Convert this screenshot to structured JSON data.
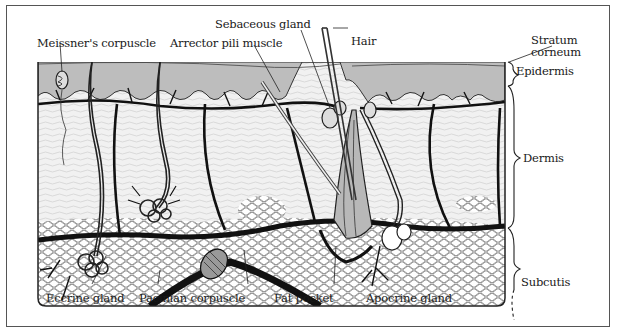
{
  "diagram": {
    "colors": {
      "frame": "#555555",
      "epidermis": "#bdbdbd",
      "dermis": "#ececec",
      "vessels": "#111111",
      "fat": "#ffffff",
      "background": "#ffffff"
    },
    "labels": {
      "meissners_corpuscle": "Meissner's corpuscle",
      "arrector_pili_muscle": "Arrector pili muscle",
      "sebaceous_gland": "Sebaceous gland",
      "hair": "Hair",
      "stratum_corneum_line1": "Stratum",
      "stratum_corneum_line2": "corneum",
      "epidermis": "Epidermis",
      "dermis": "Dermis",
      "subcutis": "Subcutis",
      "eccrine_gland": "Eccrine gland",
      "pacinian_corpuscle": "Pacinian corpuscle",
      "fat_pocket": "Fat pocket",
      "apocrine_gland": "Apocrine gland"
    },
    "layers": [
      "Stratum corneum",
      "Epidermis",
      "Dermis",
      "Subcutis"
    ]
  }
}
